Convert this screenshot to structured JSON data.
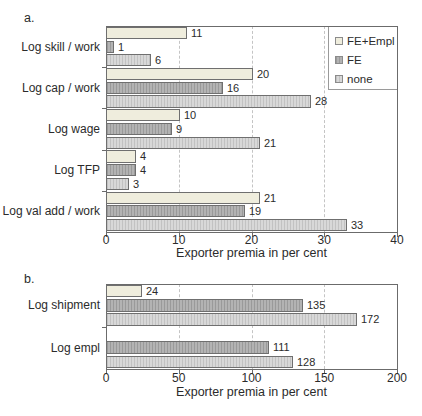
{
  "colors": {
    "fe_empl_fill": "#efeddd",
    "fe_fill": "#b3b3b3",
    "fe_stripe": "#9a9a9a",
    "none_fill": "#d8d8d8",
    "none_stripe": "#c2c2c2",
    "bar_border": "#6f6f6f",
    "frame": "#6b6b6b",
    "grid": "#c4c4c4",
    "text": "#2b2b2b"
  },
  "legend": {
    "entries": [
      {
        "label": "FE+Empl",
        "key": "fe_empl"
      },
      {
        "label": "FE",
        "key": "fe"
      },
      {
        "label": "none",
        "key": "none"
      }
    ]
  },
  "chart_data": [
    {
      "type": "bar",
      "orientation": "horizontal",
      "panel_label": "a.",
      "categories": [
        "Log skill / work",
        "Log cap / work",
        "Log wage",
        "Log TFP",
        "Log val add / work"
      ],
      "series": [
        {
          "name": "FE+Empl",
          "key": "fe_empl",
          "values": [
            11,
            20,
            10,
            4,
            21
          ]
        },
        {
          "name": "FE",
          "key": "fe",
          "values": [
            1,
            16,
            9,
            4,
            19
          ]
        },
        {
          "name": "none",
          "key": "none",
          "values": [
            6,
            28,
            21,
            3,
            33
          ]
        }
      ],
      "xlabel": "Exporter premia in per cent",
      "xlim": [
        0,
        40
      ],
      "xticks": [
        "0",
        "10",
        "20",
        "30",
        "40"
      ],
      "grid": "vertical-dashed",
      "legend_position": "top-right",
      "value_labels": true
    },
    {
      "type": "bar",
      "orientation": "horizontal",
      "panel_label": "b.",
      "categories": [
        "Log shipment",
        "Log empl"
      ],
      "series": [
        {
          "name": "FE+Empl",
          "key": "fe_empl",
          "values": [
            24,
            null
          ]
        },
        {
          "name": "FE",
          "key": "fe",
          "values": [
            135,
            111
          ]
        },
        {
          "name": "none",
          "key": "none",
          "values": [
            172,
            128
          ]
        }
      ],
      "xlabel": "Exporter premia in per cent",
      "xlim": [
        0,
        200
      ],
      "xticks": [
        "0",
        "50",
        "100",
        "150",
        "200"
      ],
      "grid": "vertical-dashed",
      "legend_position": "none",
      "value_labels": true
    }
  ]
}
